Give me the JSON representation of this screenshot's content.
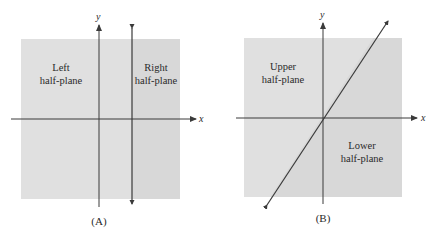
{
  "colors": {
    "background": "#ffffff",
    "region_light": "#e0e0e0",
    "region_dark": "#d6d6d6",
    "line": "#3a3a3a",
    "text": "#2a2a2a"
  },
  "panels": [
    {
      "caption": "(A)",
      "axes": {
        "x_label": "x",
        "y_label": "y"
      },
      "dividing_line": "vertical line x = c",
      "regions": [
        {
          "line1": "Left",
          "line2": "half-plane"
        },
        {
          "line1": "Right",
          "line2": "half-plane"
        }
      ]
    },
    {
      "caption": "(B)",
      "axes": {
        "x_label": "x",
        "y_label": "y"
      },
      "dividing_line": "line through origin with positive slope",
      "regions": [
        {
          "line1": "Upper",
          "line2": "half-plane"
        },
        {
          "line1": "Lower",
          "line2": "half-plane"
        }
      ]
    }
  ]
}
